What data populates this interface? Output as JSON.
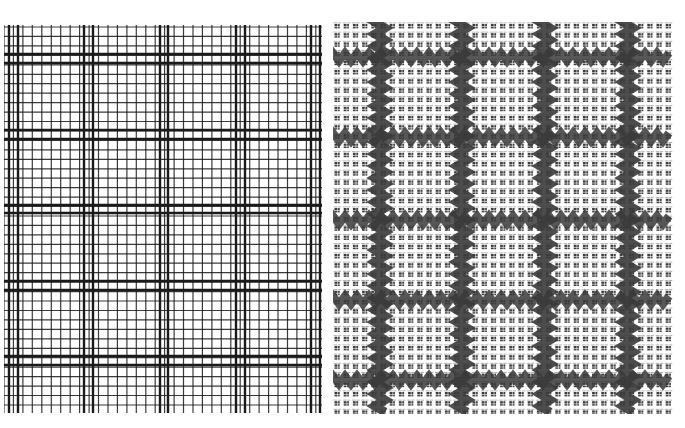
{
  "image": {
    "description": "Side-by-side comparison: drawn graph-paper grid pattern (left) and woven fabric with check pattern (right)",
    "width": 685,
    "height": 428
  },
  "left_panel": {
    "name": "graph-paper-grid",
    "cell_px": 9.45,
    "thick_every": 8,
    "line_color": "#1a1a1a",
    "background": "#ffffff"
  },
  "right_panel": {
    "name": "woven-check-fabric",
    "band_color": "#3a3a3a",
    "thread_color": "#2b2b2b",
    "background": "#ffffff"
  }
}
